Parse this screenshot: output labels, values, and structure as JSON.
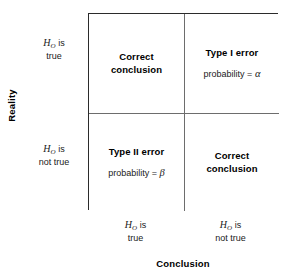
{
  "figure": {
    "y_axis_title": "Reality",
    "x_axis_title": "Conclusion",
    "hypothesis_symbol": "H",
    "hypothesis_subscript": "O"
  },
  "rows": [
    {
      "line1_suffix": " is",
      "line2": "true"
    },
    {
      "line1_suffix": " is",
      "line2": "not true"
    }
  ],
  "columns": [
    {
      "line1_suffix": " is",
      "line2": "true"
    },
    {
      "line1_suffix": " is",
      "line2": "not true"
    }
  ],
  "cells": [
    {
      "id": "correct-conclusion-top-left",
      "heading": "Correct\nconclusion",
      "sub_prefix": "",
      "sub_symbol": ""
    },
    {
      "id": "type-1-error",
      "heading": "Type I error",
      "sub_prefix": "probability = ",
      "sub_symbol": "α"
    },
    {
      "id": "type-2-error",
      "heading": "Type II error",
      "sub_prefix": "probability = ",
      "sub_symbol": "β"
    },
    {
      "id": "correct-conclusion-bottom-right",
      "heading": "Correct\nconclusion",
      "sub_prefix": "",
      "sub_symbol": ""
    }
  ],
  "colors": {
    "outer_border": "#2b2b2b",
    "inner_divider": "#6d6d6d",
    "text": "#000000",
    "background": "#ffffff"
  }
}
